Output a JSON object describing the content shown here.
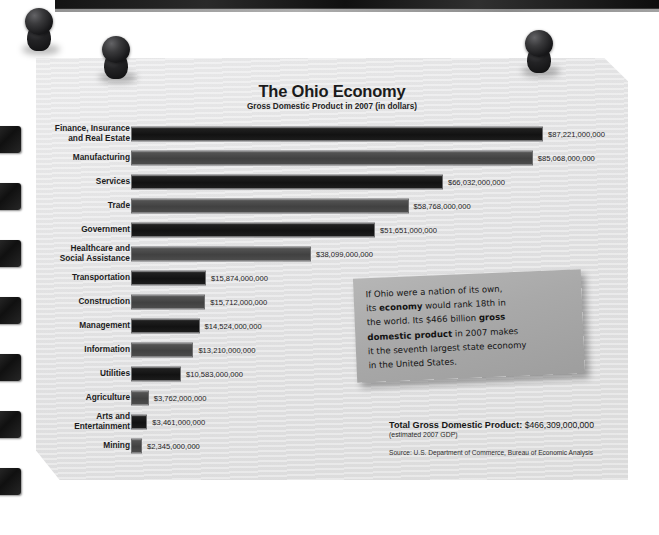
{
  "poster": {
    "title": "The Ohio Economy",
    "subtitle": "Gross Domestic Product in 2007 (in dollars)"
  },
  "note": {
    "line1_a": "If Ohio were a nation of its own,",
    "line2_a": "its ",
    "line2_b": "economy",
    "line2_c": " would rank 18th in",
    "line3_a": "the world. Its $466 billion ",
    "line3_b": "gross",
    "line4_a": "domestic product",
    "line4_b": " in 2007 makes",
    "line5": "it the seventh largest state economy",
    "line6": "in the United States."
  },
  "footer": {
    "total_label": "Total Gross Domestic Product:",
    "total_value": "$466,309,000,000",
    "estimate": "(estimated 2007 GDP)",
    "source": "Source: U.S. Department of Commerce, Bureau of Economic Analysis"
  },
  "colors": {
    "bar_dark": "#121212",
    "bar_mid": "#4a4a4a",
    "paper": "#e6e6e7",
    "note_bg": "#a9a9a9"
  },
  "chart_data": {
    "type": "bar",
    "orientation": "horizontal",
    "title": "The Ohio Economy",
    "subtitle": "Gross Domestic Product in 2007 (in dollars)",
    "xlabel": "",
    "ylabel": "",
    "unit": "dollars",
    "xlim": [
      0,
      87221000000
    ],
    "grid": false,
    "legend": null,
    "categories": [
      "Finance, Insurance and Real Estate",
      "Manufacturing",
      "Services",
      "Trade",
      "Government",
      "Healthcare and Social Assistance",
      "Transportation",
      "Construction",
      "Management",
      "Information",
      "Utilities",
      "Agriculture",
      "Arts and Entertainment",
      "Mining"
    ],
    "values": [
      87221000000,
      85068000000,
      66032000000,
      58768000000,
      51651000000,
      38099000000,
      15874000000,
      15712000000,
      14524000000,
      13210000000,
      10583000000,
      3762000000,
      3461000000,
      2345000000
    ],
    "value_labels": [
      "$87,221,000,000",
      "$85,068,000,000",
      "$66,032,000,000",
      "$58,768,000,000",
      "$51,651,000,000",
      "$38,099,000,000",
      "$15,874,000,000",
      "$15,712,000,000",
      "$14,524,000,000",
      "$13,210,000,000",
      "$10,583,000,000",
      "$3,762,000,000",
      "$3,461,000,000",
      "$2,345,000,000"
    ],
    "category_lines": [
      [
        "Finance, Insurance",
        "and Real Estate"
      ],
      [
        "Manufacturing"
      ],
      [
        "Services"
      ],
      [
        "Trade"
      ],
      [
        "Government"
      ],
      [
        "Healthcare and",
        "Social Assistance"
      ],
      [
        "Transportation"
      ],
      [
        "Construction"
      ],
      [
        "Management"
      ],
      [
        "Information"
      ],
      [
        "Utilities"
      ],
      [
        "Agriculture"
      ],
      [
        "Arts and",
        "Entertainment"
      ],
      [
        "Mining"
      ]
    ],
    "total": 466309000000,
    "total_label": "$466,309,000,000",
    "annotation": "If Ohio were a nation of its own, its economy would rank 18th in the world. Its $466 billion gross domestic product in 2007 makes it the seventh largest state economy in the United States.",
    "source": "Source: U.S. Department of Commerce, Bureau of Economic Analysis"
  }
}
